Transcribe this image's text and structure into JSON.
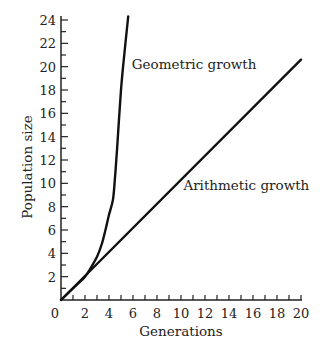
{
  "chart_data": {
    "type": "line",
    "title": "",
    "xlabel": "Generations",
    "ylabel": "Population size",
    "xlim": [
      0,
      20
    ],
    "ylim": [
      0,
      24
    ],
    "x_ticks": [
      0,
      2,
      4,
      6,
      8,
      10,
      12,
      14,
      16,
      18,
      20
    ],
    "y_ticks": [
      2,
      4,
      6,
      8,
      10,
      12,
      14,
      16,
      18,
      20,
      22,
      24
    ],
    "x_minor_step": 1,
    "y_minor_step": 1,
    "grid": false,
    "legend": "none",
    "series": [
      {
        "name": "Geometric growth",
        "x": [
          0,
          1,
          2,
          2.5,
          3,
          3.4,
          3.75,
          4.0,
          4.33,
          4.5,
          4.67,
          5.0,
          5.3,
          5.6
        ],
        "y": [
          0,
          1,
          2,
          2.8,
          3.7,
          4.8,
          6.2,
          7.3,
          8.6,
          10.5,
          12.9,
          18.0,
          21.3,
          24.3
        ]
      },
      {
        "name": "Arithmetic growth",
        "x": [
          0,
          20
        ],
        "y": [
          0,
          20.6
        ]
      }
    ],
    "annotations": [
      {
        "text": "Geometric growth",
        "x": 5.9,
        "y": 19.8
      },
      {
        "text": "Arithmetic growth",
        "x": 10.2,
        "y": 9.4
      }
    ]
  }
}
